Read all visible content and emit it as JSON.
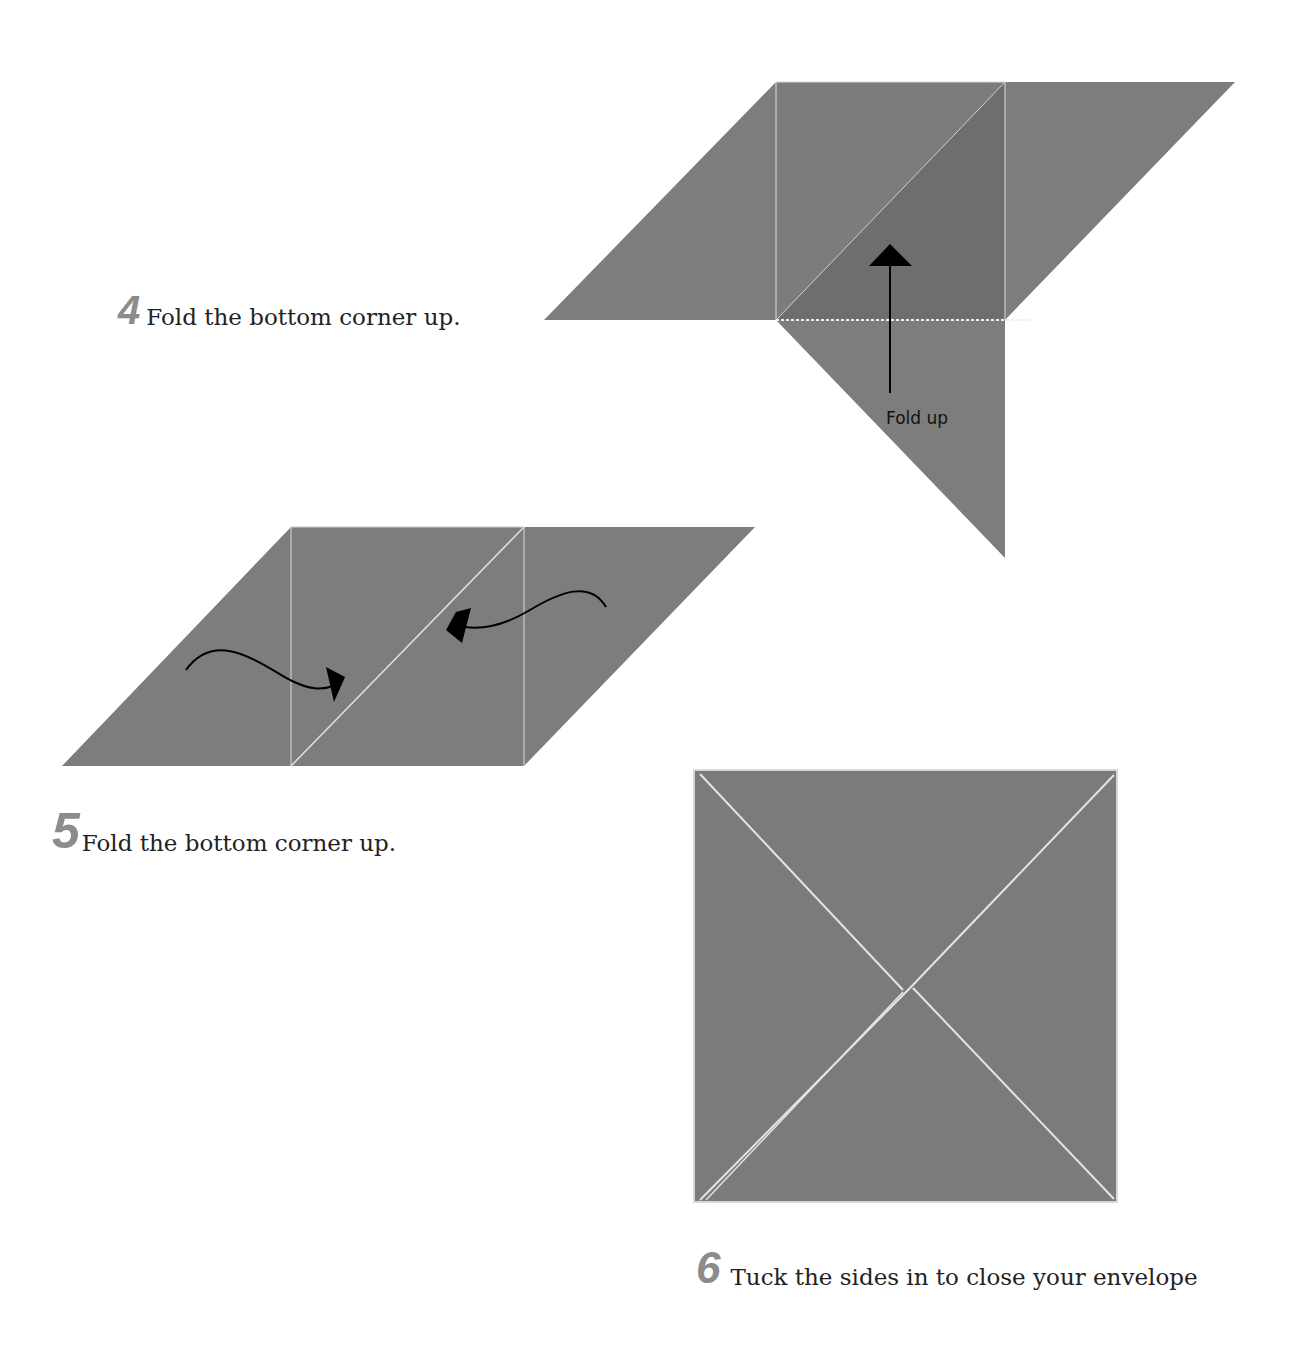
{
  "colors": {
    "paper": "#7d7d7d",
    "paper_dark": "#6f6f6f",
    "crease": "#e0e0e0",
    "arrow": "#000000",
    "step_number": "#8c8c8c",
    "text": "#222222"
  },
  "steps": [
    {
      "number": "4",
      "text": "Fold the bottom corner up.",
      "diagram_label": "Fold up"
    },
    {
      "number": "5",
      "text": "Fold the bottom corner up."
    },
    {
      "number": "6",
      "text": "Tuck the sides in to close your envelope"
    }
  ]
}
